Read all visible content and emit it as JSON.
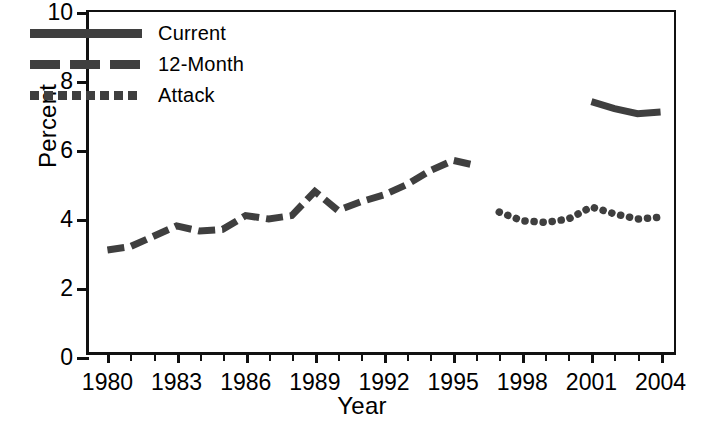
{
  "chart_data": {
    "type": "line",
    "title": "",
    "xlabel": "Year",
    "ylabel": "Percent",
    "xlim": [
      1979.2,
      2004.8
    ],
    "ylim": [
      0,
      10
    ],
    "yticks": [
      0,
      2,
      4,
      6,
      8,
      10
    ],
    "ytick_labels": [
      "0",
      "2",
      "4",
      "6",
      "8",
      "10"
    ],
    "xticks": [
      1980,
      1981,
      1982,
      1983,
      1984,
      1985,
      1986,
      1987,
      1988,
      1989,
      1990,
      1991,
      1992,
      1993,
      1994,
      1995,
      1996,
      1997,
      1998,
      1999,
      2000,
      2001,
      2002,
      2003,
      2004
    ],
    "xtick_labels": [
      "1980",
      "1983",
      "1986",
      "1989",
      "1992",
      "1995",
      "1998",
      "2001",
      "2004"
    ],
    "xtick_labeled_years": [
      1980,
      1983,
      1986,
      1989,
      1992,
      1995,
      1998,
      2001,
      2004
    ],
    "grid": false,
    "legend_position": "top-left",
    "series": [
      {
        "name": "Current",
        "style": "solid",
        "color": "#3f3f3f",
        "x": [
          2001,
          2002,
          2003,
          2004
        ],
        "values": [
          7.4,
          7.2,
          7.05,
          7.1
        ]
      },
      {
        "name": "12-Month",
        "style": "dashed",
        "color": "#3f3f3f",
        "x": [
          1980,
          1981,
          1982,
          1983,
          1984,
          1985,
          1986,
          1987,
          1988,
          1989,
          1990,
          1991,
          1992,
          1993,
          1994,
          1995,
          1996
        ],
        "values": [
          3.1,
          3.2,
          3.5,
          3.8,
          3.65,
          3.7,
          4.1,
          4.0,
          4.1,
          4.8,
          4.25,
          4.5,
          4.7,
          5.0,
          5.4,
          5.7,
          5.55
        ]
      },
      {
        "name": "Attack",
        "style": "dotted",
        "color": "#3f3f3f",
        "x": [
          1997,
          1998,
          1999,
          2000,
          2001,
          2002,
          2003,
          2004
        ],
        "values": [
          4.2,
          3.95,
          3.9,
          4.0,
          4.35,
          4.15,
          4.0,
          4.05
        ]
      }
    ]
  },
  "legend": {
    "items": [
      {
        "label": "Current",
        "style": "solid"
      },
      {
        "label": "12-Month",
        "style": "dash"
      },
      {
        "label": "Attack",
        "style": "dot"
      }
    ]
  },
  "axes": {
    "y_title": "Percent",
    "x_title": "Year"
  }
}
